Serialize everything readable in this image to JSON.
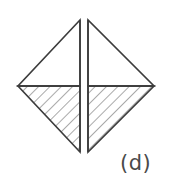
{
  "figure": {
    "label": "(d)",
    "caption_position": "bottom-right",
    "background_color": "#ffffff",
    "stroke_color": "#3c3c3c",
    "hatch_color": "#555555",
    "stroke_width": 1.6,
    "hatch_width": 1.0,
    "hatch_angle_deg": 45,
    "hatch_direction": "backslash",
    "hatch_spacing_px": 8,
    "shape": "diamond-split-vertically-into-two-halves",
    "geometry": {
      "top_y": 20,
      "bottom_y": 152,
      "left_x": 18,
      "right_x": 154,
      "mid_y": 86,
      "gap_left_x": 80,
      "gap_right_x": 88,
      "gap_width": 8
    },
    "quadrants": [
      {
        "name": "upper-left-triangle",
        "fill": "none",
        "hatched": false,
        "points": "18,86 80,86 80,20"
      },
      {
        "name": "upper-right-triangle",
        "fill": "none",
        "hatched": false,
        "points": "88,20 88,86 154,86"
      },
      {
        "name": "lower-left-triangle",
        "fill": "hatched",
        "hatched": true,
        "points": "18,86 80,86 80,152"
      },
      {
        "name": "lower-right-triangle",
        "fill": "hatched",
        "hatched": true,
        "points": "88,86 154,86 88,152"
      }
    ]
  }
}
